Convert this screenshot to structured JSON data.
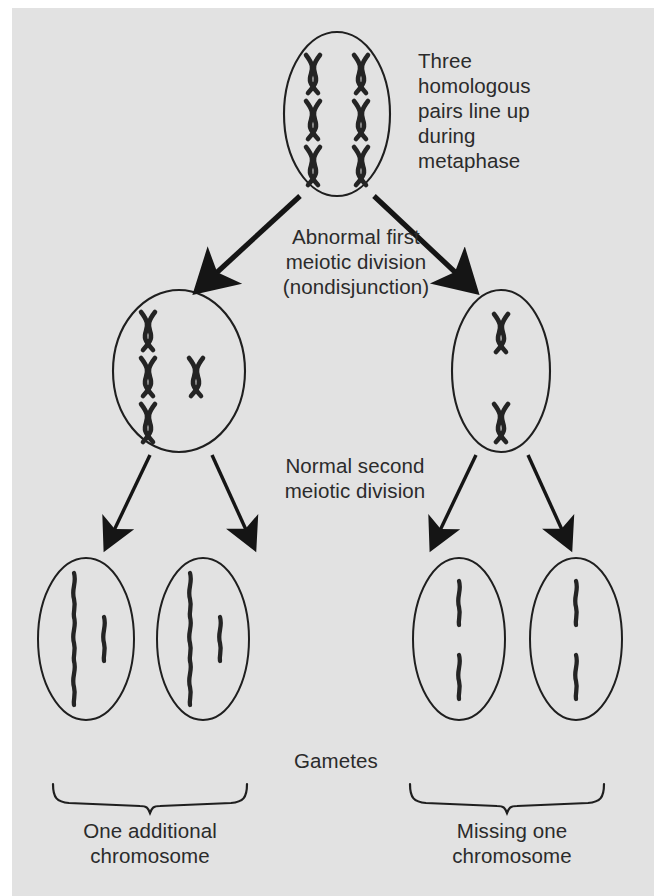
{
  "figure": {
    "background_color": "#e2e2e2",
    "page_color": "#ffffff",
    "ink_color": "#2b2b2b",
    "cell_outline_color": "#1f1f1f"
  },
  "labels": {
    "metaphase": "Three\nhomologous\npairs line up\nduring\nmetaphase",
    "first_division": "Abnormal first\nmeiotic division\n(nondisjunction)",
    "second_division": "Normal second\nmeiotic division",
    "gametes": "Gametes",
    "extra_chromosome": "One additional\nchromosome",
    "missing_chromosome": "Missing one\nchromosome"
  },
  "cells": [
    {
      "id": "parent-cell",
      "stage": "metaphase-I",
      "cx": 337,
      "cy": 114,
      "rx": 53,
      "ry": 82,
      "chromosome_type": "x-shaped",
      "chromosome_count": 6,
      "chromosomes": [
        {
          "x": 313,
          "y": 68
        },
        {
          "x": 361,
          "y": 68
        },
        {
          "x": 313,
          "y": 114
        },
        {
          "x": 361,
          "y": 114
        },
        {
          "x": 313,
          "y": 160
        },
        {
          "x": 361,
          "y": 160
        }
      ]
    },
    {
      "id": "daughter-cell-left",
      "stage": "after-meiosis-I",
      "cx": 179,
      "cy": 371,
      "rx": 66,
      "ry": 81,
      "chromosome_type": "x-shaped",
      "chromosome_count": 4,
      "chromosomes": [
        {
          "x": 148,
          "y": 325
        },
        {
          "x": 148,
          "y": 371
        },
        {
          "x": 196,
          "y": 371
        },
        {
          "x": 148,
          "y": 417
        }
      ]
    },
    {
      "id": "daughter-cell-right",
      "stage": "after-meiosis-I",
      "cx": 501,
      "cy": 371,
      "rx": 49,
      "ry": 81,
      "chromosome_type": "x-shaped",
      "chromosome_count": 2,
      "chromosomes": [
        {
          "x": 501,
          "y": 327
        },
        {
          "x": 501,
          "y": 417
        }
      ]
    },
    {
      "id": "gamete-1",
      "stage": "gamete",
      "cx": 86,
      "cy": 639,
      "rx": 48,
      "ry": 81,
      "chromosome_type": "rod",
      "chromosome_count": 4,
      "chromosomes": [
        {
          "x": 74,
          "y": 595
        },
        {
          "x": 74,
          "y": 639
        },
        {
          "x": 104,
          "y": 639
        },
        {
          "x": 74,
          "y": 683
        }
      ]
    },
    {
      "id": "gamete-2",
      "stage": "gamete",
      "cx": 203,
      "cy": 639,
      "rx": 46,
      "ry": 81,
      "chromosome_type": "rod",
      "chromosome_count": 4,
      "chromosomes": [
        {
          "x": 190,
          "y": 595
        },
        {
          "x": 190,
          "y": 639
        },
        {
          "x": 220,
          "y": 639
        },
        {
          "x": 190,
          "y": 683
        }
      ]
    },
    {
      "id": "gamete-3",
      "stage": "gamete",
      "cx": 459,
      "cy": 639,
      "rx": 46,
      "ry": 81,
      "chromosome_type": "rod",
      "chromosome_count": 2,
      "chromosomes": [
        {
          "x": 459,
          "y": 595
        },
        {
          "x": 459,
          "y": 683
        }
      ]
    },
    {
      "id": "gamete-4",
      "stage": "gamete",
      "cx": 576,
      "cy": 639,
      "rx": 46,
      "ry": 81,
      "chromosome_type": "rod",
      "chromosome_count": 2,
      "chromosomes": [
        {
          "x": 576,
          "y": 595
        },
        {
          "x": 576,
          "y": 683
        }
      ]
    }
  ],
  "arrows": [
    {
      "id": "arrow-parent-to-left",
      "from": [
        300,
        196
      ],
      "to": [
        202,
        288
      ],
      "weight": "thick"
    },
    {
      "id": "arrow-parent-to-right",
      "from": [
        374,
        196
      ],
      "to": [
        470,
        288
      ],
      "weight": "thick"
    },
    {
      "id": "arrow-left-to-gamete1",
      "from": [
        150,
        455
      ],
      "to": [
        106,
        545
      ],
      "weight": "thin"
    },
    {
      "id": "arrow-left-to-gamete2",
      "from": [
        212,
        455
      ],
      "to": [
        254,
        545
      ],
      "weight": "thin"
    },
    {
      "id": "arrow-right-to-gamete3",
      "from": [
        476,
        455
      ],
      "to": [
        432,
        545
      ],
      "weight": "thin"
    },
    {
      "id": "arrow-right-to-gamete4",
      "from": [
        528,
        455
      ],
      "to": [
        570,
        545
      ],
      "weight": "thin"
    }
  ],
  "braces": [
    {
      "id": "brace-left",
      "x_start": 53,
      "x_end": 247,
      "y": 784,
      "label": "One additional\nchromosome"
    },
    {
      "id": "brace-right",
      "x_start": 410,
      "x_end": 604,
      "y": 784,
      "label": "Missing one\nchromosome"
    }
  ]
}
